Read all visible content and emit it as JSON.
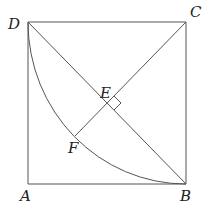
{
  "diagram": {
    "type": "geometry",
    "points": {
      "A": {
        "label": "A",
        "x": 28,
        "y": 184
      },
      "B": {
        "label": "B",
        "x": 186,
        "y": 184
      },
      "C": {
        "label": "C",
        "x": 186,
        "y": 22
      },
      "D": {
        "label": "D",
        "x": 28,
        "y": 22
      },
      "E": {
        "label": "E",
        "x": 107,
        "y": 103
      },
      "F": {
        "label": "F",
        "x": 75,
        "y": 136
      }
    },
    "segments": [
      "AB",
      "BC",
      "CD",
      "DA",
      "DB",
      "CF"
    ],
    "arcs": [
      {
        "center": "C",
        "from": "D",
        "to": "B"
      }
    ],
    "right_angle_marks": [
      "E"
    ],
    "line_color": "#555555"
  }
}
